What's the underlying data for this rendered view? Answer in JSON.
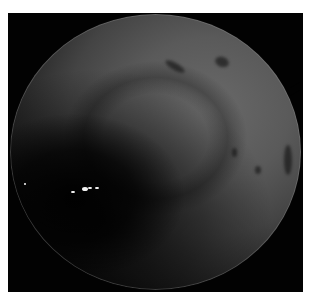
{
  "image": {
    "description": "Grayscale circular endoscopic/microscopic view on black background with white border",
    "colors": {
      "border": "#ffffff",
      "background": "#020202",
      "tissue_light": "#6a6a6a",
      "tissue_dark": "#222222",
      "specks": "#f2f2f2"
    },
    "features": {
      "dark_marks": [
        {
          "x": 175,
          "y": 66,
          "w": 22,
          "h": 7,
          "rot": 30
        },
        {
          "x": 222,
          "y": 62,
          "w": 14,
          "h": 10,
          "rot": 20
        },
        {
          "x": 234,
          "y": 152,
          "w": 5,
          "h": 9,
          "rot": 0
        },
        {
          "x": 258,
          "y": 170,
          "w": 6,
          "h": 8,
          "rot": 0
        },
        {
          "x": 288,
          "y": 160,
          "w": 8,
          "h": 30,
          "rot": 0
        }
      ],
      "bright_specks": [
        {
          "x": 73,
          "y": 192,
          "r": 2
        },
        {
          "x": 85,
          "y": 189,
          "r": 3
        },
        {
          "x": 90,
          "y": 188,
          "r": 2
        },
        {
          "x": 97,
          "y": 188,
          "r": 2
        },
        {
          "x": 25,
          "y": 184,
          "r": 1
        }
      ]
    }
  }
}
